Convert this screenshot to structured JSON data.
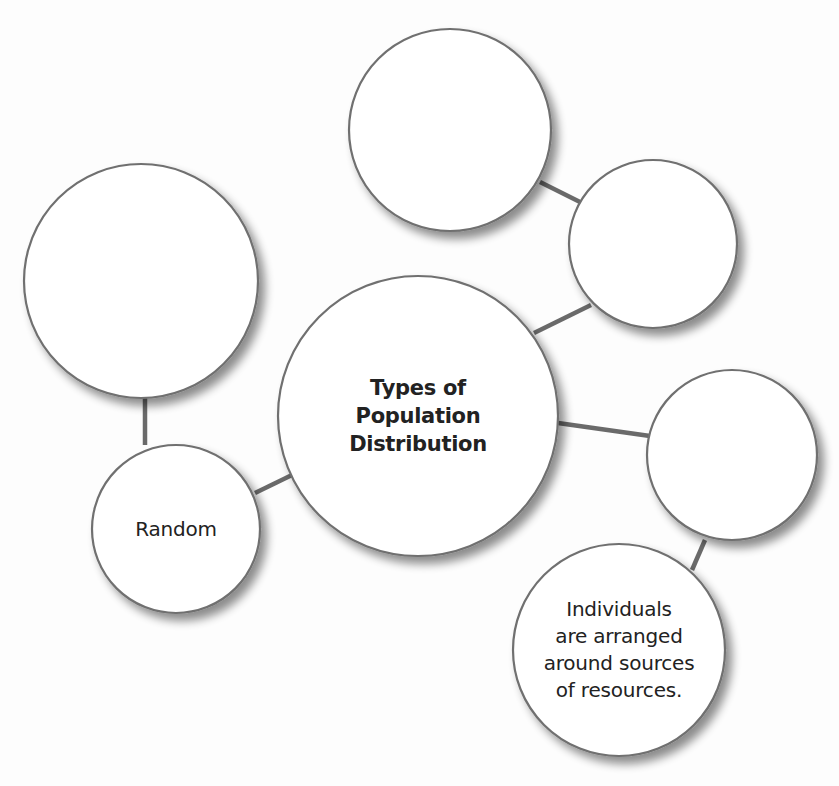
{
  "diagram": {
    "title": "Types of Population Distribution",
    "type": "concept-web",
    "colors": {
      "background": "#fdfdfd",
      "node_fill": "#ffffff",
      "node_stroke": "#707070",
      "connector": "#6a6a6a",
      "text": "#222222"
    },
    "nodes": [
      {
        "id": "center",
        "label": "Types of\nPopulation\nDistribution",
        "style": "center"
      },
      {
        "id": "top-left-blank",
        "label": "",
        "style": "normal"
      },
      {
        "id": "random",
        "label": "Random",
        "style": "normal"
      },
      {
        "id": "top-blank",
        "label": "",
        "style": "normal"
      },
      {
        "id": "top-right-blank",
        "label": "",
        "style": "normal"
      },
      {
        "id": "right-blank",
        "label": "",
        "style": "normal"
      },
      {
        "id": "clumped-description",
        "label": "Individuals\nare arranged\naround sources\nof resources.",
        "style": "normal"
      }
    ],
    "edges": [
      {
        "from": "center",
        "to": "random"
      },
      {
        "from": "random",
        "to": "top-left-blank"
      },
      {
        "from": "center",
        "to": "top-right-blank"
      },
      {
        "from": "top-right-blank",
        "to": "top-blank"
      },
      {
        "from": "center",
        "to": "right-blank"
      },
      {
        "from": "right-blank",
        "to": "clumped-description"
      }
    ]
  }
}
